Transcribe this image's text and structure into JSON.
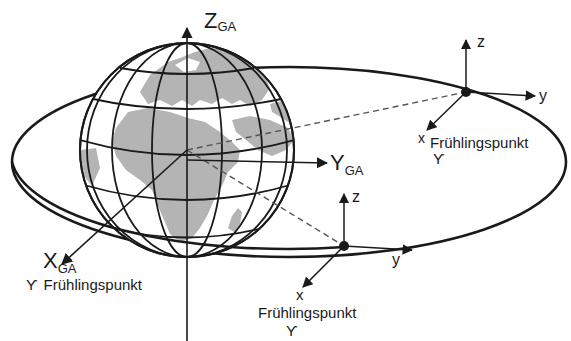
{
  "diagram": {
    "type": "orbit-coordinate-frames",
    "colors": {
      "line": "#1a1a1a",
      "land": "#b4b4b4",
      "background": "#ffffff",
      "dashed": "#555555"
    },
    "earth_frame": {
      "z_axis": {
        "main": "Z",
        "sub": "GA"
      },
      "y_axis": {
        "main": "Y",
        "sub": "GA"
      },
      "x_axis": {
        "main": "X",
        "sub": "GA"
      },
      "x_caption_symbol": "ϒ",
      "x_caption": "Frühlingspunkt"
    },
    "orbit_frame_upper": {
      "z_label": "z",
      "y_label": "y",
      "x_label": "x",
      "caption": "Frühlingspunkt",
      "caption_symbol": "ϒ"
    },
    "orbit_frame_lower": {
      "z_label": "z",
      "y_label": "y",
      "x_label": "x",
      "caption": "Frühlingspunkt",
      "caption_symbol": "ϒ"
    }
  }
}
